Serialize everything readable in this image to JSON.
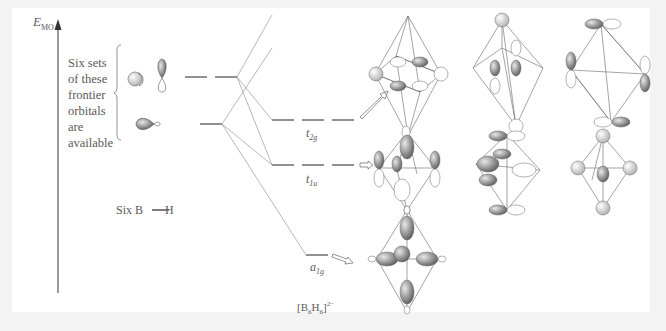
{
  "axis": {
    "label_main": "E",
    "label_sub": "MO"
  },
  "note": {
    "text": "Six sets of these frontier orbitals are available"
  },
  "fragment": {
    "label_left": "Six B",
    "label_right": "H"
  },
  "levels": [
    {
      "symbol": "t",
      "subscript": "2g",
      "degeneracy": 3
    },
    {
      "symbol": "t",
      "subscript": "1u",
      "degeneracy": 3
    },
    {
      "symbol": "a",
      "subscript": "1g",
      "degeneracy": 1
    }
  ],
  "molecule": {
    "formula_parts": [
      "[B",
      "6",
      "H",
      "6",
      "]",
      "2−"
    ]
  },
  "colors": {
    "line": "#888888",
    "lobe_dark": "#6a6a6a",
    "lobe_light": "#dcdcdc"
  }
}
